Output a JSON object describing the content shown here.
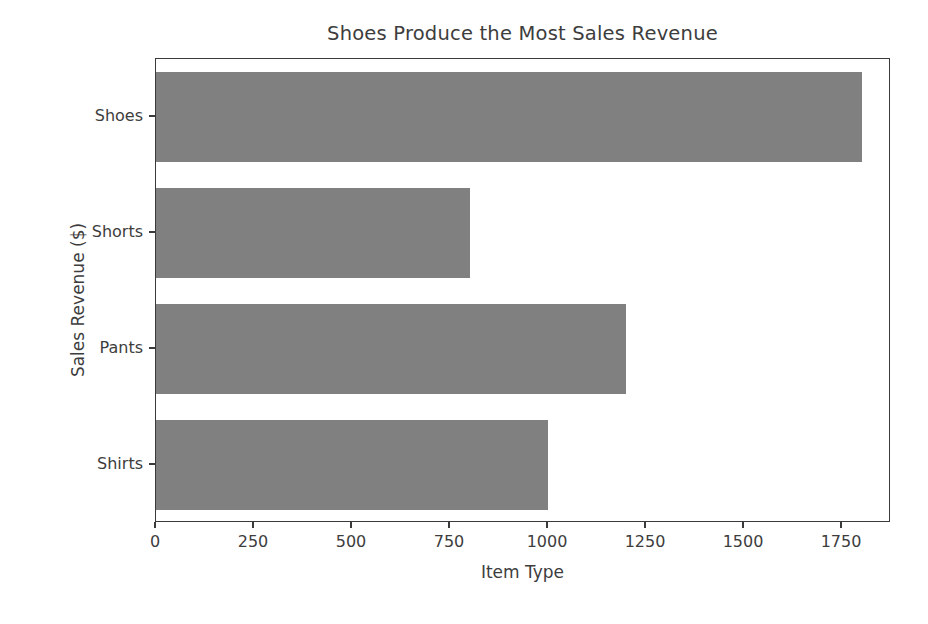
{
  "figure": {
    "background_color": "#ffffff",
    "axes_border_color": "#3a3a3a",
    "text_color": "#3d3d3d"
  },
  "chart_data": {
    "type": "bar",
    "orientation": "horizontal",
    "title": "Shoes Produce the Most Sales Revenue",
    "xlabel": "Item Type",
    "ylabel": "Sales Revenue ($)",
    "categories": [
      "Shirts",
      "Pants",
      "Shorts",
      "Shoes"
    ],
    "values": [
      1000,
      1200,
      800,
      1800
    ],
    "bar_color": "#808080",
    "xlim": [
      0,
      1875
    ],
    "xticks": [
      0,
      250,
      500,
      750,
      1000,
      1250,
      1500,
      1750
    ],
    "xtick_labels": [
      "0",
      "250",
      "500",
      "750",
      "1000",
      "1250",
      "1500",
      "1750"
    ],
    "ytick_labels": [
      "Shirts",
      "Pants",
      "Shorts",
      "Shoes"
    ],
    "grid": false,
    "legend": null,
    "bars": [
      {
        "label": "Shoes",
        "value": 1800
      },
      {
        "label": "Shorts",
        "value": 800
      },
      {
        "label": "Pants",
        "value": 1200
      },
      {
        "label": "Shirts",
        "value": 1000
      }
    ]
  }
}
